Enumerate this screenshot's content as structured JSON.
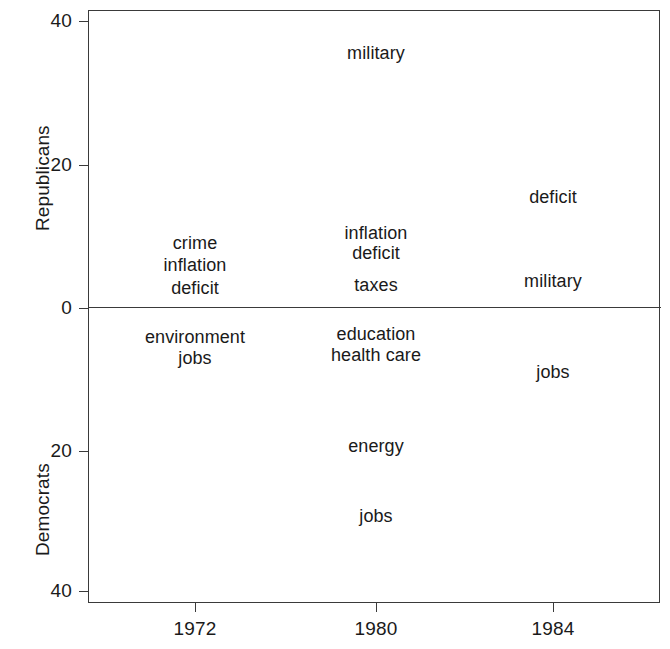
{
  "chart_data": {
    "type": "scatter",
    "title": "",
    "subtitle": "",
    "xlabel": "",
    "ylabel_top": "Republicans",
    "ylabel_bottom": "Democrats",
    "grid": false,
    "legend": "none",
    "x_axis": {
      "tick_labels": [
        "1972",
        "1980",
        "1984"
      ],
      "tick_values": [
        1972,
        1980,
        1984
      ],
      "range_note": "1970 to 1986 approx"
    },
    "y_axis_top": {
      "label": "Republicans",
      "tick_labels": [
        "40",
        "20",
        "0"
      ],
      "tick_values": [
        40,
        20,
        0
      ],
      "ylim": [
        0,
        41.5
      ],
      "direction": "increasing upward"
    },
    "y_axis_bottom": {
      "label": "Democrats",
      "tick_labels": [
        "0",
        "20",
        "40"
      ],
      "tick_values": [
        0,
        20,
        40
      ],
      "ylim": [
        0,
        41.5
      ],
      "direction": "increasing downward"
    },
    "annotations": [
      {
        "text": "military",
        "year": 1980,
        "group": "Republicans",
        "value": 36
      },
      {
        "text": "deficit",
        "year": 1984,
        "group": "Republicans",
        "value": 15.5
      },
      {
        "text": "inflation",
        "year": 1980,
        "group": "Republicans",
        "value": 10.5
      },
      {
        "text": "deficit",
        "year": 1980,
        "group": "Republicans",
        "value": 7.5
      },
      {
        "text": "crime",
        "year": 1972,
        "group": "Republicans",
        "value": 9
      },
      {
        "text": "inflation",
        "year": 1972,
        "group": "Republicans",
        "value": 6
      },
      {
        "text": "taxes",
        "year": 1980,
        "group": "Republicans",
        "value": 2.5
      },
      {
        "text": "deficit",
        "year": 1972,
        "group": "Republicans",
        "value": 3
      },
      {
        "text": "military",
        "year": 1984,
        "group": "Republicans",
        "value": 2.5
      },
      {
        "text": "environment",
        "year": 1972,
        "group": "Democrats",
        "value": 4
      },
      {
        "text": "education",
        "year": 1980,
        "group": "Democrats",
        "value": 4
      },
      {
        "text": "jobs",
        "year": 1972,
        "group": "Democrats",
        "value": 7
      },
      {
        "text": "health care",
        "year": 1980,
        "group": "Democrats",
        "value": 7
      },
      {
        "text": "jobs",
        "year": 1984,
        "group": "Democrats",
        "value": 9
      },
      {
        "text": "energy",
        "year": 1980,
        "group": "Democrats",
        "value": 19.5
      },
      {
        "text": "jobs",
        "year": 1980,
        "group": "Democrats",
        "value": 29
      }
    ]
  },
  "layout": {
    "ytick_pixels": [
      {
        "label": "40",
        "y": 21
      },
      {
        "label": "20",
        "y": 165
      },
      {
        "label": "0",
        "y": 308
      },
      {
        "label": "20",
        "y": 451
      },
      {
        "label": "40",
        "y": 591
      }
    ],
    "xtick_pixels": [
      {
        "label": "1972",
        "x": 195
      },
      {
        "label": "1980",
        "x": 376
      },
      {
        "label": "1984",
        "x": 553
      }
    ],
    "labels_pixels": [
      {
        "text": "military",
        "x": 376,
        "y": 53
      },
      {
        "text": "deficit",
        "x": 553,
        "y": 197
      },
      {
        "text": "inflation",
        "x": 376,
        "y": 233
      },
      {
        "text": "crime",
        "x": 195,
        "y": 243
      },
      {
        "text": "deficit",
        "x": 376,
        "y": 253
      },
      {
        "text": "inflation",
        "x": 195,
        "y": 265
      },
      {
        "text": "taxes",
        "x": 376,
        "y": 285
      },
      {
        "text": "deficit",
        "x": 195,
        "y": 288
      },
      {
        "text": "military",
        "x": 553,
        "y": 281
      },
      {
        "text": "environment",
        "x": 195,
        "y": 337
      },
      {
        "text": "education",
        "x": 376,
        "y": 334
      },
      {
        "text": "jobs",
        "x": 195,
        "y": 358
      },
      {
        "text": "health care",
        "x": 376,
        "y": 355
      },
      {
        "text": "jobs",
        "x": 553,
        "y": 372
      },
      {
        "text": "energy",
        "x": 376,
        "y": 446
      },
      {
        "text": "jobs",
        "x": 376,
        "y": 516
      }
    ],
    "axis_titles_pixels": [
      {
        "text": "Republicans",
        "x": 33,
        "y": 231
      },
      {
        "text": "Democrats",
        "x": 33,
        "y": 556
      }
    ]
  },
  "colors": {
    "background": "#ffffff",
    "axis": "#3a3a3a",
    "text": "#1a1a1a"
  }
}
